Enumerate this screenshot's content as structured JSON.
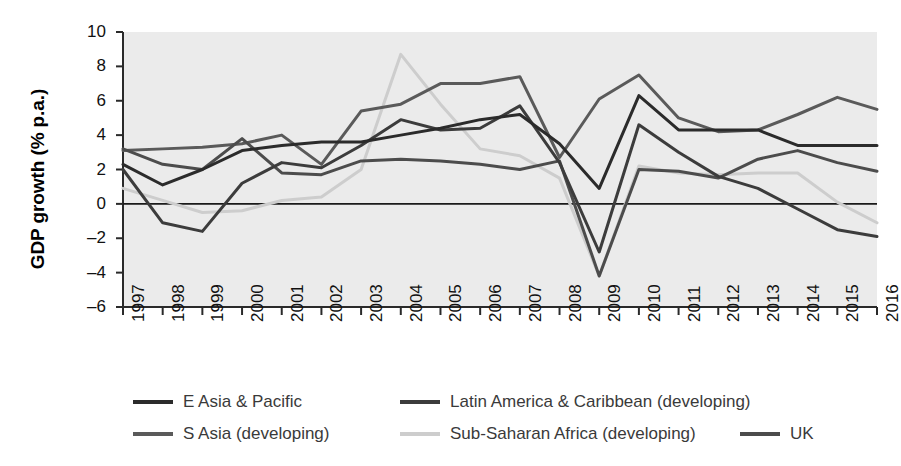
{
  "chart_data": {
    "type": "line",
    "title": "",
    "xlabel": "",
    "ylabel": "GDP growth (% p.a.)",
    "ylim": [
      -6,
      10
    ],
    "yticks": [
      10,
      8,
      6,
      4,
      2,
      0,
      -2,
      -4,
      -6
    ],
    "ytick_labels": [
      "10",
      "8",
      "6",
      "4",
      "2",
      "0",
      "–2",
      "–4",
      "–6"
    ],
    "grid": false,
    "plot_background": "#ebebeb",
    "zero_line": true,
    "legend_position": "bottom",
    "x": [
      1997,
      1998,
      1999,
      2000,
      2001,
      2002,
      2003,
      2004,
      2005,
      2006,
      2007,
      2008,
      2009,
      2010,
      2011,
      2012,
      2013,
      2014,
      2015,
      2016
    ],
    "categories": [
      "1997",
      "1998",
      "1999",
      "2000",
      "2001",
      "2002",
      "2003",
      "2004",
      "2005",
      "2006",
      "2007",
      "2008",
      "2009",
      "2010",
      "2011",
      "2012",
      "2013",
      "2014",
      "2015",
      "2016"
    ],
    "series": [
      {
        "name": "E Asia & Pacific",
        "color": "#2b2b2b",
        "values": [
          2.3,
          1.1,
          2.0,
          3.1,
          3.4,
          3.6,
          3.6,
          4.0,
          4.4,
          4.9,
          5.2,
          3.5,
          0.9,
          6.3,
          4.3,
          4.3,
          4.3,
          3.4,
          3.4,
          3.4
        ]
      },
      {
        "name": "Latin America & Caribbean (developing)",
        "color": "#3c3c3c",
        "values": [
          2.0,
          -1.1,
          -1.6,
          1.2,
          2.4,
          2.1,
          3.4,
          4.9,
          4.3,
          4.4,
          5.7,
          2.4,
          -2.8,
          4.6,
          3.0,
          1.6,
          0.9,
          -0.3,
          -1.5,
          -1.9
        ]
      },
      {
        "name": "S Asia (developing)",
        "color": "#5a5a5a",
        "values": [
          3.1,
          3.2,
          3.3,
          3.5,
          4.0,
          2.3,
          5.4,
          5.8,
          7.0,
          7.0,
          7.4,
          2.7,
          6.1,
          7.5,
          5.0,
          4.2,
          4.3,
          5.2,
          6.2,
          5.5
        ]
      },
      {
        "name": "Sub-Saharan Africa (developing)",
        "color": "#cdcdcd",
        "values": [
          0.9,
          0.2,
          -0.5,
          -0.4,
          0.2,
          0.4,
          2.0,
          8.7,
          5.8,
          3.2,
          2.8,
          1.5,
          -4.2,
          2.2,
          1.8,
          1.7,
          1.8,
          1.8,
          0.1,
          -1.1
        ]
      },
      {
        "name": "UK",
        "color": "#4c4c4c",
        "values": [
          3.2,
          2.3,
          2.0,
          3.8,
          1.8,
          1.7,
          2.5,
          2.6,
          2.5,
          2.3,
          2.0,
          2.5,
          -4.2,
          2.0,
          1.9,
          1.5,
          2.6,
          3.1,
          2.4,
          1.9
        ]
      }
    ]
  },
  "legend": {
    "entries": [
      {
        "label": "E Asia & Pacific",
        "color": "#2b2b2b"
      },
      {
        "label": "Latin America & Caribbean (developing)",
        "color": "#3c3c3c"
      },
      {
        "label": "S Asia (developing)",
        "color": "#5a5a5a"
      },
      {
        "label": "Sub-Saharan Africa (developing)",
        "color": "#cdcdcd"
      },
      {
        "label": "UK",
        "color": "#4c4c4c"
      }
    ]
  }
}
